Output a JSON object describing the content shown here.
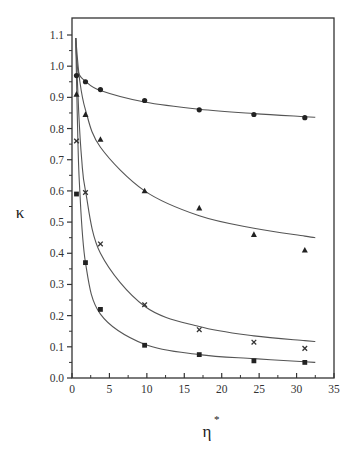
{
  "chart_data": {
    "type": "scatter",
    "title": "",
    "xlabel": "η*",
    "ylabel": "κ",
    "xlim": [
      0,
      35
    ],
    "ylim": [
      0,
      1.1
    ],
    "grid": false,
    "legend": "none",
    "x_ticks": [
      "0",
      "5",
      "10",
      "15",
      "20",
      "25",
      "30",
      "35"
    ],
    "y_ticks": [
      "0.0",
      "0.1",
      "0.2",
      "0.3",
      "0.4",
      "0.5",
      "0.6",
      "0.7",
      "0.8",
      "0.9",
      "1.0",
      "1.1"
    ],
    "x": [
      0.6,
      1.8,
      3.8,
      9.7,
      17.0,
      24.3,
      31.1
    ],
    "series": [
      {
        "name": "circles",
        "marker": "circle",
        "values": [
          0.97,
          0.95,
          0.925,
          0.89,
          0.86,
          0.845,
          0.835
        ],
        "fit_curve": [
          [
            0.5,
            1.09
          ],
          [
            0.8,
            0.985
          ],
          [
            1.8,
            0.952
          ],
          [
            3.8,
            0.922
          ],
          [
            9.7,
            0.885
          ],
          [
            17.0,
            0.862
          ],
          [
            24.3,
            0.848
          ],
          [
            31.1,
            0.838
          ],
          [
            32.5,
            0.836
          ]
        ]
      },
      {
        "name": "triangles",
        "marker": "triangle",
        "values": [
          0.91,
          0.845,
          0.765,
          0.6,
          0.545,
          0.46,
          0.41
        ],
        "fit_curve": [
          [
            0.5,
            1.09
          ],
          [
            1.0,
            0.96
          ],
          [
            1.8,
            0.86
          ],
          [
            3.8,
            0.74
          ],
          [
            9.7,
            0.6
          ],
          [
            17.0,
            0.52
          ],
          [
            24.3,
            0.48
          ],
          [
            31.1,
            0.455
          ],
          [
            32.5,
            0.45
          ]
        ]
      },
      {
        "name": "crosses",
        "marker": "x",
        "values": [
          0.76,
          0.595,
          0.43,
          0.235,
          0.155,
          0.115,
          0.095
        ],
        "fit_curve": [
          [
            0.5,
            1.09
          ],
          [
            0.9,
            0.85
          ],
          [
            1.3,
            0.7
          ],
          [
            1.8,
            0.6
          ],
          [
            3.8,
            0.4
          ],
          [
            9.7,
            0.23
          ],
          [
            17.0,
            0.165
          ],
          [
            24.3,
            0.135
          ],
          [
            31.1,
            0.12
          ],
          [
            32.5,
            0.117
          ]
        ]
      },
      {
        "name": "squares",
        "marker": "square",
        "values": [
          0.59,
          0.37,
          0.22,
          0.105,
          0.075,
          0.055,
          0.05
        ],
        "fit_curve": [
          [
            0.5,
            1.09
          ],
          [
            0.7,
            0.85
          ],
          [
            1.0,
            0.62
          ],
          [
            1.8,
            0.37
          ],
          [
            3.8,
            0.205
          ],
          [
            9.7,
            0.108
          ],
          [
            17.0,
            0.075
          ],
          [
            24.3,
            0.062
          ],
          [
            31.1,
            0.052
          ],
          [
            32.5,
            0.05
          ]
        ]
      }
    ]
  },
  "labels": {
    "xlabel_main": "η",
    "xlabel_sup": "*",
    "ylabel": "κ"
  }
}
